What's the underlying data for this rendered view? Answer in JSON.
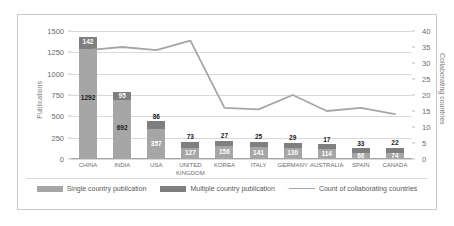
{
  "chart_data": {
    "type": "bar",
    "title": "",
    "subtitle": "",
    "xlabel": "",
    "ylabel": "Publications",
    "y2label": "Collaborating countries",
    "ylim": [
      0,
      1500
    ],
    "y2lim": [
      0,
      40
    ],
    "yticks": [
      0,
      250,
      500,
      750,
      1000,
      1250,
      1500
    ],
    "y2ticks": [
      0,
      5,
      10,
      15,
      20,
      25,
      30,
      35,
      40
    ],
    "grid": true,
    "stacked": true,
    "legend_position": "bottom",
    "categories": [
      "CHINA",
      "INDIA",
      "USA",
      "UNITED\nKINGDOM",
      "KOREA",
      "ITALY",
      "GERMANY",
      "AUSTRALIA",
      "SPAIN",
      "CANADA"
    ],
    "series": [
      {
        "name": "Single country publication",
        "type": "bar",
        "axis": "left",
        "color": "#a6a6a6",
        "values": [
          1292,
          692,
          357,
          127,
          156,
          141,
          130,
          114,
          66,
          74
        ]
      },
      {
        "name": "Multiple country publication",
        "type": "bar",
        "axis": "left",
        "color": "#7f7f7f",
        "values": [
          142,
          95,
          86,
          73,
          27,
          25,
          29,
          17,
          33,
          22
        ]
      },
      {
        "name": "Count of collaborating countries",
        "type": "line",
        "axis": "right",
        "color": "#a6a6a6",
        "values": [
          34,
          35,
          34,
          37,
          16,
          15.5,
          20,
          15,
          16,
          14
        ]
      }
    ]
  },
  "axes": {
    "left_title": "Publications",
    "right_title": "Collaborating countries",
    "left_ticks": [
      "1500",
      "1250",
      "1000",
      "750",
      "500",
      "250",
      "0"
    ],
    "right_ticks": [
      "40",
      "35",
      "30",
      "25",
      "20",
      "15",
      "10",
      "5",
      "0"
    ]
  },
  "legend": {
    "items": [
      {
        "label": "Single country publication",
        "marker": "swatch",
        "color": "#a6a6a6"
      },
      {
        "label": "Multiple country publication",
        "marker": "swatch",
        "color": "#7f7f7f"
      },
      {
        "label": "Count of collaborating countries",
        "marker": "line",
        "color": "#a6a6a6"
      }
    ]
  },
  "colors": {
    "single": "#a6a6a6",
    "multiple": "#7f7f7f",
    "line": "#a6a6a6",
    "grid": "#d9d9d9",
    "frame": "#c9c9c9",
    "tick_text": "#6b6b6b"
  }
}
